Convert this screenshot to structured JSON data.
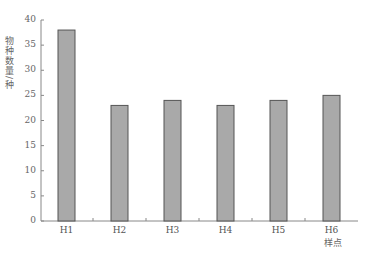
{
  "chart_data": {
    "type": "bar",
    "title": "",
    "xlabel": "样点",
    "ylabel": "物种数量/种",
    "categories": [
      "H1",
      "H2",
      "H3",
      "H4",
      "H5",
      "H6"
    ],
    "values": [
      38,
      23,
      24,
      23,
      24,
      25
    ],
    "ylim": [
      0,
      40
    ],
    "yticks": [
      0,
      5,
      10,
      15,
      20,
      25,
      30,
      35,
      40
    ],
    "grid": false,
    "legend": null,
    "bar_color": "#a9a9a9",
    "bar_edge_color": "#555555"
  }
}
